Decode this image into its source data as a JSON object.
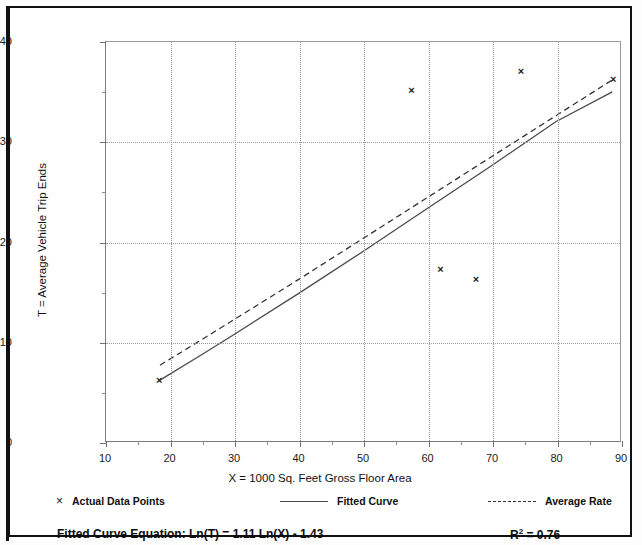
{
  "chart_data": {
    "type": "scatter",
    "title": "",
    "xlabel": "X = 1000 Sq. Feet Gross Floor Area",
    "ylabel": "T = Average Vehicle Trip Ends",
    "xlim": [
      10,
      90
    ],
    "ylim": [
      0,
      40
    ],
    "xticks": [
      10,
      20,
      30,
      40,
      50,
      60,
      70,
      80,
      90
    ],
    "yticks": [
      0,
      10,
      20,
      30,
      40
    ],
    "xminor": [
      15,
      25,
      35,
      45,
      55,
      65,
      75,
      85
    ],
    "yminor": [
      5,
      15,
      25,
      35
    ],
    "grid": true,
    "legend_position": "bottom",
    "series": [
      {
        "name": "Actual Data Points",
        "type": "scatter",
        "marker": "x",
        "points": [
          {
            "x": 18.4,
            "y": 6.1
          },
          {
            "x": 57.5,
            "y": 35.1
          },
          {
            "x": 62.0,
            "y": 17.2
          },
          {
            "x": 67.5,
            "y": 16.2
          },
          {
            "x": 74.5,
            "y": 37.0
          },
          {
            "x": 88.8,
            "y": 36.2
          }
        ]
      },
      {
        "name": "Fitted Curve",
        "type": "line",
        "style": "solid",
        "points": [
          {
            "x": 18.4,
            "y": 6.1
          },
          {
            "x": 25.0,
            "y": 8.7
          },
          {
            "x": 30.0,
            "y": 10.7
          },
          {
            "x": 40.0,
            "y": 14.8
          },
          {
            "x": 50.0,
            "y": 19.0
          },
          {
            "x": 60.0,
            "y": 23.3
          },
          {
            "x": 70.0,
            "y": 27.6
          },
          {
            "x": 80.0,
            "y": 32.0
          },
          {
            "x": 88.8,
            "y": 35.0
          }
        ]
      },
      {
        "name": "Average Rate",
        "type": "line",
        "style": "dashed",
        "points": [
          {
            "x": 18.4,
            "y": 7.6
          },
          {
            "x": 25.0,
            "y": 10.2
          },
          {
            "x": 30.0,
            "y": 12.2
          },
          {
            "x": 40.0,
            "y": 16.2
          },
          {
            "x": 50.0,
            "y": 20.3
          },
          {
            "x": 60.0,
            "y": 24.4
          },
          {
            "x": 70.0,
            "y": 28.5
          },
          {
            "x": 80.0,
            "y": 32.6
          },
          {
            "x": 88.8,
            "y": 36.2
          }
        ]
      }
    ]
  },
  "axis": {
    "x_title": "X = 1000 Sq. Feet Gross Floor Area",
    "y_title": "T = Average Vehicle Trip Ends",
    "x_tick_labels": [
      "10",
      "20",
      "30",
      "40",
      "50",
      "60",
      "70",
      "80",
      "90"
    ],
    "y_tick_labels": [
      "0",
      "10",
      "20",
      "30",
      "40"
    ]
  },
  "legend": {
    "data_points_label": "Actual Data Points",
    "data_points_marker": "×",
    "fitted_curve_label": "Fitted Curve",
    "average_rate_label": "Average Rate"
  },
  "footer": {
    "equation": "Fitted Curve Equation:  Ln(T) = 1.11 Ln(X) - 1.43",
    "r_squared_prefix": "R",
    "r_squared_sup": "2",
    "r_squared_value": " = 0.76"
  },
  "colors": {
    "fitted_curve": "#4a4a4a",
    "average_rate": "#333333",
    "marker": "#1b1b1b",
    "grid": "#9a9a9a",
    "border": "#111111"
  }
}
